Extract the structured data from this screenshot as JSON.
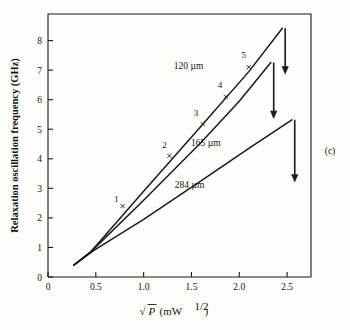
{
  "figure": {
    "panel_label": "(c)",
    "background_color": "#fdfdfb",
    "line_color": "#1a1a1a"
  },
  "chart_data": {
    "type": "line",
    "title": "",
    "xlabel": "√P (mW¹ᐟ²)",
    "xlabel_parts": {
      "radical": "√",
      "variable": "P",
      "unit_open": "(mW",
      "exponent": "1/2",
      "unit_close": ")"
    },
    "ylabel": "Relaxation oscillation frequency (GHz)",
    "xlim": [
      0,
      2.75
    ],
    "ylim": [
      0,
      8.9
    ],
    "xticks": [
      "0",
      "0.5",
      "1.0",
      "1.5",
      "2.0",
      "2.5"
    ],
    "xtick_values": [
      0,
      0.5,
      1.0,
      1.5,
      2.0,
      2.5
    ],
    "yticks": [
      "0",
      "1",
      "2",
      "3",
      "4",
      "5",
      "6",
      "7",
      "8"
    ],
    "ytick_values": [
      0,
      1,
      2,
      3,
      4,
      5,
      6,
      7,
      8
    ],
    "grid": false,
    "legend": "inline-curve-labels",
    "series": [
      {
        "name": "120 µm",
        "label": "120 µm",
        "label_x": 1.47,
        "label_y": 7.03,
        "points": [
          {
            "x": 0.27,
            "y": 0.4
          },
          {
            "x": 0.45,
            "y": 0.86
          },
          {
            "x": 1.0,
            "y": 2.9
          },
          {
            "x": 1.6,
            "y": 5.1
          },
          {
            "x": 2.1,
            "y": 6.95
          },
          {
            "x": 2.45,
            "y": 8.42
          }
        ],
        "arrow": {
          "x": 2.48,
          "y_start": 8.42,
          "y_end": 6.95
        }
      },
      {
        "name": "165 µm",
        "label": "165 µm",
        "label_x": 1.65,
        "label_y": 4.45,
        "points": [
          {
            "x": 0.27,
            "y": 0.4
          },
          {
            "x": 0.45,
            "y": 0.86
          },
          {
            "x": 1.0,
            "y": 2.6
          },
          {
            "x": 1.6,
            "y": 4.55
          },
          {
            "x": 2.0,
            "y": 5.95
          },
          {
            "x": 2.33,
            "y": 7.26
          }
        ],
        "arrow": {
          "x": 2.36,
          "y_start": 7.26,
          "y_end": 5.45
        }
      },
      {
        "name": "284 µm",
        "label": "284 µm",
        "label_x": 1.48,
        "label_y": 3.0,
        "points": [
          {
            "x": 0.27,
            "y": 0.4
          },
          {
            "x": 0.48,
            "y": 0.9
          },
          {
            "x": 1.0,
            "y": 1.95
          },
          {
            "x": 1.6,
            "y": 3.25
          },
          {
            "x": 2.1,
            "y": 4.35
          },
          {
            "x": 2.55,
            "y": 5.32
          }
        ],
        "arrow": {
          "x": 2.58,
          "y_start": 5.32,
          "y_end": 3.3
        }
      }
    ],
    "markers": [
      {
        "label": "1",
        "x": 0.78,
        "y": 2.4,
        "label_dx": -6,
        "label_dy": -4
      },
      {
        "label": "2",
        "x": 1.27,
        "y": 4.1,
        "label_dx": -5,
        "label_dy": -8
      },
      {
        "label": "3",
        "x": 1.62,
        "y": 5.17,
        "label_dx": -7,
        "label_dy": -8
      },
      {
        "label": "4",
        "x": 1.86,
        "y": 6.1,
        "label_dx": -6,
        "label_dy": -9
      },
      {
        "label": "5",
        "x": 2.1,
        "y": 7.1,
        "label_dx": -5,
        "label_dy": -9
      }
    ]
  }
}
